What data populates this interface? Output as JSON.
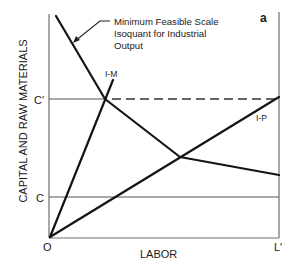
{
  "figure": {
    "panel_label": "a",
    "y_axis_label": "CAPITAL AND RAW MATERIALS",
    "x_axis_label": "LABOR",
    "origin_label": "O",
    "x_max_label": "L′",
    "y_ticks": {
      "c_prime": "C′",
      "c": "C"
    },
    "annotation": {
      "line1": "Minimum Feasible Scale",
      "line2": "Isoquant for Industrial",
      "line3": "Output"
    },
    "rays": {
      "im": "I-M",
      "ip": "I-P"
    },
    "colors": {
      "ink": "#141414",
      "axis": "#6e6e6e",
      "background": "#ffffff"
    }
  }
}
